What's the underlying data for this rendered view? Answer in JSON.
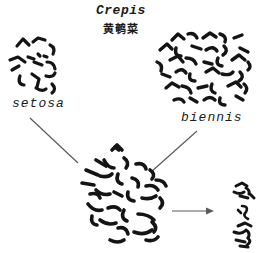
{
  "figure": {
    "title": "Crepis",
    "subtitle_cn": "黄鹌菜",
    "left_species": "setosa",
    "right_species": "biennis",
    "colors": {
      "background": "#ffffff",
      "ink": "#141414",
      "connector_line": "#5a5a5a"
    }
  }
}
